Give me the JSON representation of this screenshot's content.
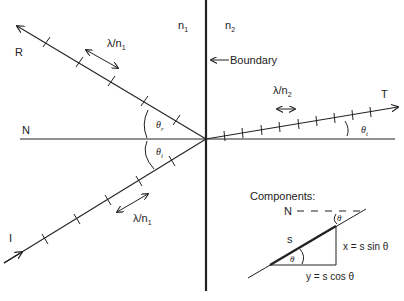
{
  "diagram": {
    "type": "refraction-reflection wave diagram",
    "media": {
      "left_index": "n",
      "left_sub": "1",
      "right_index": "n",
      "right_sub": "2"
    },
    "boundary_label": "Boundary",
    "normal_label": "N",
    "rays": {
      "reflected": {
        "label": "R",
        "wavelength_label": "λ/n",
        "wavelength_sub": "1",
        "angle": "θ",
        "angle_sub": "r"
      },
      "incident": {
        "label": "I",
        "wavelength_label": "λ/n",
        "wavelength_sub": "1",
        "angle": "θ",
        "angle_sub": "i"
      },
      "transmitted": {
        "label": "T",
        "wavelength_label": "λ/n",
        "wavelength_sub": "2",
        "angle": "θ",
        "angle_sub": "t"
      }
    },
    "components_inset": {
      "title": "Components:",
      "normal_label": "N",
      "hyp_label": "s",
      "angle": "θ",
      "x_eq": "x = s sin θ",
      "y_eq": "y = s cos θ"
    }
  },
  "colors": {
    "ink": "#222222",
    "background": "#ffffff"
  }
}
